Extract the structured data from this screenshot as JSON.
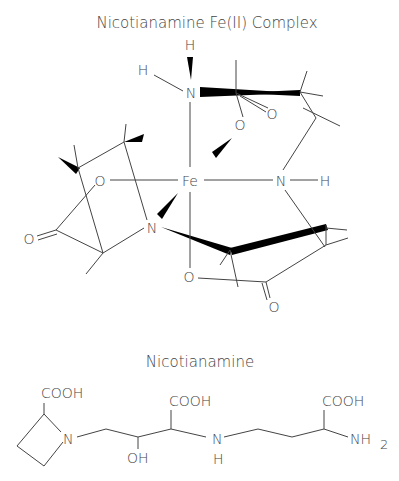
{
  "complex": {
    "title": "Nicotianamine Fe(II) Complex",
    "atoms": {
      "fe": "Fe",
      "h_top": "H",
      "h_left": "H",
      "n_top": "N",
      "n_right": "N",
      "h_right": "H",
      "n_left": "N",
      "o_carboxyl_top": "O",
      "o_carbonyl_top": "O",
      "o_left": "O",
      "o_carbonyl_left": "O",
      "o_bottom": "O",
      "o_carbonyl_bottom": "O"
    }
  },
  "molecule": {
    "title": "Nicotianamine",
    "groups": {
      "cooh_1": "COOH",
      "cooh_2": "COOH",
      "cooh_3": "COOH",
      "n_ring": "N",
      "oh": "OH",
      "nh_n": "N",
      "nh_h": "H",
      "nh2": "NH",
      "nh2_sub": "2"
    }
  }
}
